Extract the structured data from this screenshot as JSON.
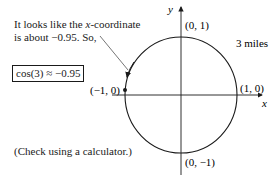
{
  "annotation": {
    "line1_prefix": "It looks like the ",
    "line1_var": "x",
    "line1_suffix": "-coordinate",
    "line2": "is about −0.95. So,"
  },
  "result_box": "cos(3) ≈ −0.95",
  "footnote": "(Check using a calculator.)",
  "diagram": {
    "x_axis_label": "x",
    "y_axis_label": "y",
    "points": {
      "top": "(0, 1)",
      "bottom": "(0, −1)",
      "left": "(−1, 0)",
      "right": "(1, 0)"
    },
    "arc_label": "3 miles",
    "circle": {
      "center": [
        0,
        0
      ],
      "radius": 1
    },
    "highlighted_point": {
      "x": -0.95,
      "y": 0.31,
      "label": "endpoint after 3 miles"
    }
  }
}
